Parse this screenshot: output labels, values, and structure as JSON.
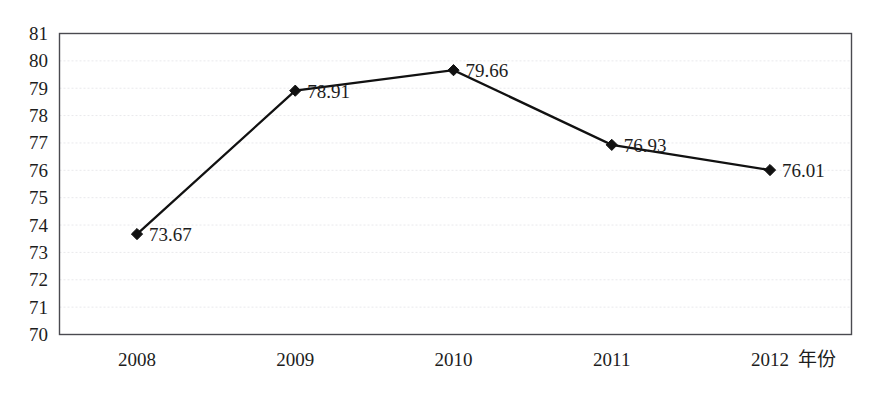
{
  "chart_data": {
    "type": "line",
    "title": "",
    "subtitle": "",
    "xlabel": "年份",
    "ylabel": "",
    "categories": [
      "2008",
      "2009",
      "2010",
      "2011",
      "2012"
    ],
    "values": [
      73.67,
      78.91,
      79.66,
      76.93,
      76.01
    ],
    "series": [
      {
        "name": "",
        "values": [
          73.67,
          78.91,
          79.66,
          76.93,
          76.01
        ],
        "marker": "diamond",
        "color": "#111111"
      }
    ],
    "point_labels": [
      "73.67",
      "78.91",
      "79.66",
      "76.93",
      "76.01"
    ],
    "ylim": [
      70,
      81
    ],
    "yticks": [
      70,
      71,
      72,
      73,
      74,
      75,
      76,
      77,
      78,
      79,
      80,
      81
    ],
    "ytick_labels": [
      "70",
      "71",
      "72",
      "73",
      "74",
      "75",
      "76",
      "77",
      "78",
      "79",
      "80",
      "81"
    ],
    "xtick_labels": [
      "2008",
      "2009",
      "2010",
      "2011",
      "2012"
    ],
    "grid": {
      "horizontal": true,
      "vertical": false,
      "style": "dotted",
      "color": "#e9e9ec"
    },
    "legend": {
      "visible": false,
      "position": "none",
      "entries": []
    },
    "annotations": [],
    "colors": {
      "line": "#111111",
      "marker": "#111111",
      "border": "#4a4a50",
      "grid": "#e9e9ec",
      "background": "#ffffff",
      "text": "#1d1d1d"
    }
  }
}
